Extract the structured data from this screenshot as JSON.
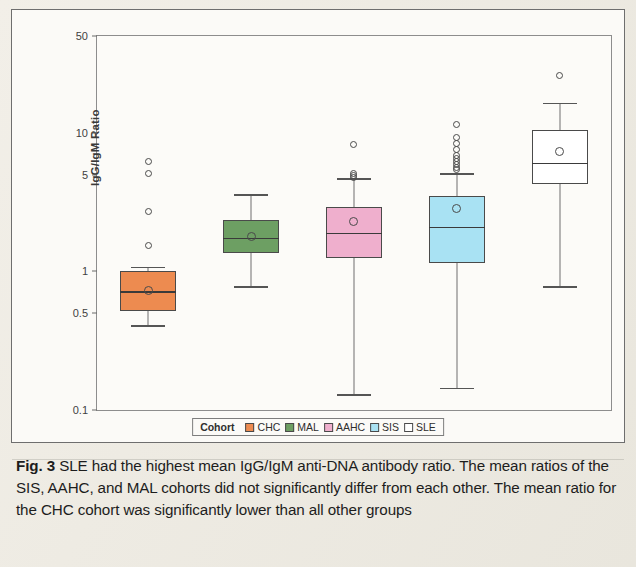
{
  "figure": {
    "panel_name": "boxplot-figure",
    "y_axis": {
      "label": "IgG/IgM Ratio",
      "scale": "log",
      "ticks": [
        "50",
        "10",
        "5",
        "1",
        "0.5",
        "0.1"
      ]
    },
    "legend": {
      "title": "Cohort",
      "items": [
        {
          "label": "CHC",
          "color": "#ED8B50"
        },
        {
          "label": "MAL",
          "color": "#6D9F63"
        },
        {
          "label": "AAHC",
          "color": "#EFAFCD"
        },
        {
          "label": "SIS",
          "color": "#A9E2F3"
        },
        {
          "label": "SLE",
          "color": "#FFFFFF"
        }
      ]
    }
  },
  "caption": {
    "label": "Fig. 3",
    "text": "SLE had the highest mean IgG/IgM anti-DNA antibody ratio. The mean ratios of the SIS, AAHC, and MAL cohorts did not significantly differ from each other. The mean ratio for the CHC cohort was significantly lower than all other groups"
  },
  "chart_data": {
    "type": "box",
    "title": "",
    "xlabel": "",
    "ylabel": "IgG/IgM Ratio",
    "yscale": "log",
    "ylim": [
      0.1,
      50
    ],
    "yticks": [
      0.1,
      0.5,
      1,
      5,
      10,
      50
    ],
    "grid": false,
    "legend_position": "bottom",
    "categories": [
      "CHC",
      "MAL",
      "AAHC",
      "SIS",
      "SLE"
    ],
    "series": [
      {
        "name": "CHC",
        "color": "#ED8B50",
        "whisker_low": 0.41,
        "q1": 0.52,
        "median": 0.72,
        "q3": 1.0,
        "whisker_high": 1.08,
        "mean": 0.73,
        "outliers": [
          6.2,
          5.1,
          2.7,
          1.55
        ]
      },
      {
        "name": "MAL",
        "color": "#6D9F63",
        "whisker_low": 0.78,
        "q1": 1.35,
        "median": 1.75,
        "q3": 2.35,
        "whisker_high": 3.6,
        "mean": 1.8,
        "outliers": []
      },
      {
        "name": "AAHC",
        "color": "#EFAFCD",
        "whisker_low": 0.13,
        "q1": 1.25,
        "median": 1.9,
        "q3": 2.9,
        "whisker_high": 4.7,
        "mean": 2.3,
        "outliers": [
          8.2,
          5.1,
          4.9,
          4.8
        ]
      },
      {
        "name": "SIS",
        "color": "#A9E2F3",
        "whisker_low": 0.145,
        "q1": 1.15,
        "median": 2.1,
        "q3": 3.5,
        "whisker_high": 5.1,
        "mean": 2.85,
        "outliers": [
          11.5,
          9.2,
          8.4,
          7.6,
          6.9,
          6.5,
          6.2,
          5.9,
          5.6,
          5.4
        ]
      },
      {
        "name": "SLE",
        "color": "#FFFFFF",
        "whisker_low": 0.78,
        "q1": 4.3,
        "median": 6.1,
        "q3": 10.5,
        "whisker_high": 16.5,
        "mean": 7.3,
        "outliers": [
          26.0
        ]
      }
    ]
  }
}
